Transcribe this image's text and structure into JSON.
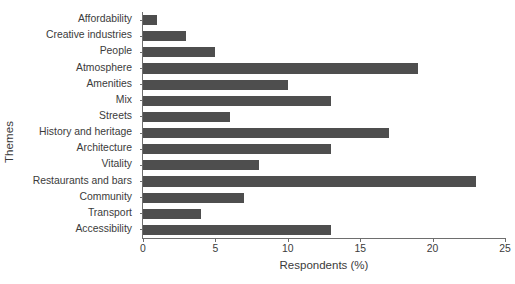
{
  "chart_data": {
    "type": "bar",
    "orientation": "horizontal",
    "title": "",
    "xlabel": "Respondents (%)",
    "ylabel": "Themes",
    "xlim": [
      0,
      25
    ],
    "xticks": [
      0,
      5,
      10,
      15,
      20,
      25
    ],
    "xtick_labels": [
      "0",
      "5",
      "10",
      "15",
      "20",
      "25"
    ],
    "grid": false,
    "legend": null,
    "bar_color": "#4e4e4e",
    "axis_color": "#6e6e6e",
    "text_color": "#3b3b3b",
    "categories": [
      "Affordability",
      "Creative industries",
      "People",
      "Atmosphere",
      "Amenities",
      "Mix",
      "Streets",
      "History and heritage",
      "Architecture",
      "Vitality",
      "Restaurants and bars",
      "Community",
      "Transport",
      "Accessibility"
    ],
    "values": [
      1,
      3,
      5,
      19,
      10,
      13,
      6,
      17,
      13,
      8,
      23,
      7,
      4,
      13
    ]
  }
}
